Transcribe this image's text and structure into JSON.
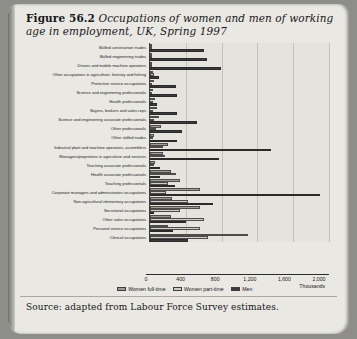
{
  "figure": {
    "label": "Figure 56.2",
    "caption": "Occupations of women and men of working age in employment, UK, Spring 1997",
    "source": "Source: adapted from Labour Force Survey estimates."
  },
  "colors": {
    "women_full_time": "#9d9c97",
    "women_part_time": "#cfcec9",
    "men": "#3c3c3e",
    "page_background": "#e9e8e3",
    "plot_background": "#e4e3de",
    "axis": "#2c2c2c",
    "gridline": "#c2c1bb"
  },
  "chart_data": {
    "type": "bar",
    "orientation": "horizontal",
    "grouped": true,
    "title": "Occupations of women and men of working age in employment, UK, Spring 1997",
    "xlabel": "Thousands",
    "ylabel": "",
    "xlim": [
      0,
      2000
    ],
    "xticks": [
      0,
      400,
      800,
      1200,
      1600,
      2000
    ],
    "xticklabels": [
      "0",
      "400",
      "800",
      "1,200",
      "1,600",
      "2,000"
    ],
    "grid": true,
    "legend_position": "bottom",
    "categories": [
      "Skilled construction trades",
      "Skilled engineering trades",
      "Drivers and mobile machine operators",
      "Other occupations in agriculture, forestry and fishing",
      "Protective service occupations",
      "Science and engineering professionals",
      "Health professionals",
      "Buyers, brokers and sales reps",
      "Science and engineering associate professionals",
      "Other professionals",
      "Other skilled trades",
      "Industrial plant and machine operators, assemblers",
      "Managers/proprietors in agriculture and services",
      "Teaching associate professionals",
      "Health associate professionals",
      "Teaching professionals",
      "Corporate managers and administrators occupations",
      "Non-agricultural elementary occupations",
      "Secretarial occupations",
      "Other sales occupations",
      "Personal service occupations",
      "Clerical occupations"
    ],
    "series": [
      {
        "name": "Women full-time",
        "color": "#9d9c97",
        "values": [
          5,
          10,
          15,
          30,
          40,
          35,
          60,
          75,
          95,
          120,
          45,
          200,
          150,
          60,
          230,
          330,
          560,
          250,
          560,
          230,
          200,
          1100
        ]
      },
      {
        "name": "Women part-time",
        "color": "#cfcec9",
        "values": [
          3,
          5,
          10,
          45,
          15,
          10,
          30,
          35,
          40,
          70,
          35,
          150,
          170,
          40,
          290,
          200,
          180,
          420,
          330,
          600,
          560,
          650
        ]
      },
      {
        "name": "Men",
        "color": "#3c3c3e",
        "values": [
          600,
          640,
          790,
          100,
          290,
          300,
          80,
          300,
          520,
          360,
          300,
          1350,
          770,
          110,
          110,
          280,
          1900,
          700,
          40,
          400,
          260,
          420
        ]
      }
    ],
    "legend": [
      "Women full-time",
      "Women part-time",
      "Men"
    ]
  }
}
